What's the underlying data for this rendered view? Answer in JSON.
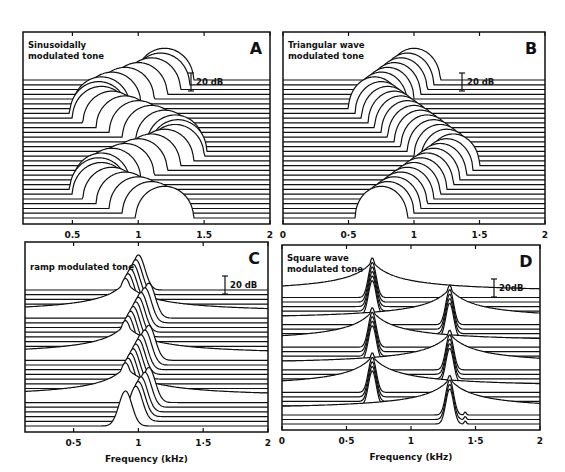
{
  "figure": {
    "ink_color": "#111111",
    "background": "#ffffff"
  },
  "chart_data": [
    {
      "id": "A",
      "type": "line",
      "subtype": "waterfall",
      "panel_letter": "A",
      "title_lines": [
        "Sinusoidally",
        "modulated tone"
      ],
      "scale_bar_label": "20 dB",
      "xlabel": "",
      "x_tick_labels": [
        "0.5",
        "1",
        "1.5",
        "2"
      ],
      "x_ticks": [
        0.5,
        1,
        1.5,
        2
      ],
      "xlim": [
        0.125,
        2
      ],
      "grid": false,
      "num_traces": 30,
      "description": "Stacked spectra of a tone whose frequency is sinusoidally modulated; the peak sweeps between ~0.7 and ~1.3 kHz forming two sinusoidal cycles across traces",
      "peak_frequency_khz_by_trace": [
        1.2,
        1.17,
        1.1,
        1.0,
        0.9,
        0.8,
        0.72,
        0.7,
        0.72,
        0.8,
        0.9,
        1.0,
        1.1,
        1.2,
        1.28,
        1.3,
        1.28,
        1.2,
        1.1,
        1.0,
        0.9,
        0.8,
        0.72,
        0.7,
        0.72,
        0.8,
        0.9,
        1.0,
        1.1,
        1.2
      ],
      "peak_height_db": 22,
      "peak_width_khz": 0.22
    },
    {
      "id": "B",
      "type": "line",
      "subtype": "waterfall",
      "panel_letter": "B",
      "title_lines": [
        "Triangular wave",
        "modulated tone"
      ],
      "scale_bar_label": "20 dB",
      "xlabel": "",
      "x_tick_labels": [
        "0",
        "0·5",
        "1",
        "1·5",
        "2"
      ],
      "x_ticks": [
        0,
        0.5,
        1,
        1.5,
        2
      ],
      "xlim": [
        0,
        2
      ],
      "grid": false,
      "num_traces": 30,
      "description": "Stacked spectra of a tone with triangular-wave frequency modulation; peak moves linearly between ~0.7 and ~1.3 kHz",
      "peak_frequency_khz_by_trace": [
        1.0,
        0.95,
        0.9,
        0.85,
        0.8,
        0.75,
        0.7,
        0.75,
        0.8,
        0.85,
        0.9,
        0.95,
        1.0,
        1.05,
        1.1,
        1.15,
        1.2,
        1.25,
        1.3,
        1.25,
        1.2,
        1.15,
        1.1,
        1.05,
        1.0,
        0.95,
        0.9,
        0.85,
        0.8,
        0.75
      ],
      "peak_height_db": 22,
      "peak_width_khz": 0.2
    },
    {
      "id": "C",
      "type": "line",
      "subtype": "waterfall",
      "panel_letter": "C",
      "title_lines": [
        "ramp modulated tone"
      ],
      "scale_bar_label": "20 dB",
      "xlabel": "Frequency (kHz)",
      "x_tick_labels": [
        "0·5",
        "1",
        "1·5",
        "2"
      ],
      "x_ticks": [
        0.5,
        1,
        1.5,
        2
      ],
      "xlim": [
        0.125,
        2
      ],
      "grid": false,
      "num_traces": 30,
      "description": "Stacked spectra of a ramp (sawtooth) frequency-modulated tone; repeated sweeps from ~0.9 to ~1.05 kHz with broad skirts on the sweep onset traces",
      "peak_frequency_khz_by_trace": [
        1.0,
        0.98,
        0.96,
        0.94,
        0.92,
        0.9,
        1.08,
        1.05,
        1.02,
        1.0,
        0.98,
        0.96,
        0.94,
        0.92,
        0.9,
        1.08,
        1.05,
        1.02,
        1.0,
        0.98,
        0.96,
        0.94,
        0.92,
        0.9,
        1.08,
        1.05,
        1.02,
        1.0,
        0.98,
        0.9
      ],
      "peak_height_db": 30,
      "broad_skirt_traces": [
        5,
        14,
        23
      ],
      "peak_width_khz": 0.1
    },
    {
      "id": "D",
      "type": "line",
      "subtype": "waterfall",
      "panel_letter": "D",
      "title_lines": [
        "Square wave",
        "modulated tone"
      ],
      "scale_bar_label": "20dB",
      "xlabel": "Frequency (kHz)",
      "x_tick_labels": [
        "0",
        "0·5",
        "1",
        "1·5",
        "2"
      ],
      "x_ticks": [
        0,
        0.5,
        1,
        1.5,
        2
      ],
      "xlim": [
        0,
        2
      ],
      "grid": false,
      "num_traces": 30,
      "description": "Stacked spectra of a tone with square-wave frequency modulation alternating between ~0.7 and ~1.3 kHz; transitions show broad skirts; small residual bump near 1.42 kHz in lowest traces",
      "peak_frequency_khz_by_trace": [
        0.7,
        0.7,
        0.7,
        0.7,
        0.7,
        0.7,
        1.3,
        1.3,
        1.3,
        1.3,
        1.3,
        0.7,
        0.7,
        0.7,
        0.7,
        0.7,
        1.3,
        1.3,
        1.3,
        1.3,
        1.3,
        0.7,
        0.7,
        0.7,
        0.7,
        0.7,
        1.3,
        1.3,
        1.3,
        1.3
      ],
      "peak_height_db": 30,
      "secondary_bump_khz": 1.42,
      "peak_width_khz": 0.06
    }
  ]
}
